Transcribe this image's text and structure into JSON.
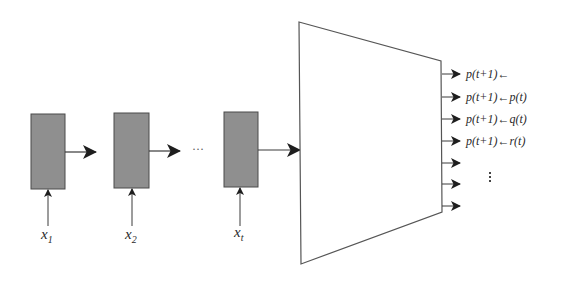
{
  "diagram": {
    "colors": {
      "box_fill": "#8f8f8f",
      "box_stroke": "#4a4a4a",
      "line": "#3a3a3a",
      "arrowhead": "#1e1e1e",
      "trapezoid_stroke": "#555555"
    },
    "inputs": [
      {
        "var": "x",
        "sub": "1"
      },
      {
        "var": "x",
        "sub": "2"
      },
      {
        "var": "x",
        "sub": "t"
      }
    ],
    "sequence_ellipsis": "···",
    "outputs": [
      {
        "label": "p(t+1)←"
      },
      {
        "label": "p(t+1)←p(t)"
      },
      {
        "label": "p(t+1)←q(t)"
      },
      {
        "label": "p(t+1)←r(t)"
      },
      {
        "label": ""
      },
      {
        "label": ""
      },
      {
        "label": ""
      }
    ],
    "output_ellipsis": "vertical-dots"
  }
}
